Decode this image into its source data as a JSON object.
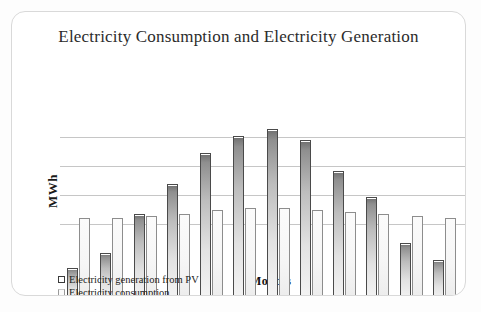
{
  "panel": {
    "title": "Electricity Consumption and Electricity Generation"
  },
  "axes": {
    "ylabel": "MWh",
    "xlabel": "Months"
  },
  "legend": {
    "items": [
      {
        "label": "Electricity generation from PV",
        "marker": "legend-swatch-generation"
      },
      {
        "label": "Electricity consumption",
        "marker": "legend-swatch-consumption"
      }
    ]
  },
  "chart_data": {
    "type": "bar",
    "title": "Electricity Consumption and Electricity Generation",
    "xlabel": "Months",
    "ylabel": "MWh",
    "grid": true,
    "gridlines": 4,
    "legend_position": "bottom-left",
    "categories": [
      "Jan",
      "Feb",
      "Mar",
      "Apr",
      "May",
      "Jun",
      "Jul",
      "Aug",
      "Sep",
      "Oct",
      "Nov",
      "Dec"
    ],
    "ylim": [
      0,
      100
    ],
    "series": [
      {
        "name": "Electricity generation from PV",
        "values": [
          17,
          25,
          46,
          62,
          79,
          88,
          92,
          86,
          69,
          55,
          30,
          21
        ]
      },
      {
        "name": "Electricity consumption",
        "values": [
          44,
          44,
          45,
          46,
          48,
          49,
          49,
          48,
          47,
          46,
          45,
          44
        ]
      }
    ]
  }
}
